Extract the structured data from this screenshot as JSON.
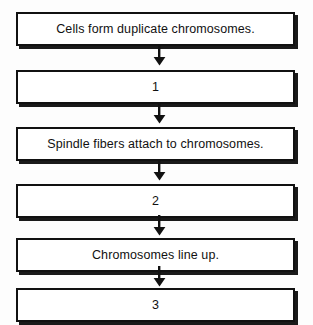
{
  "worksheet": {
    "background_color": "#fdfdfd",
    "ink_color": "#111111",
    "steps": [
      {
        "kind": "text",
        "label": "Cells form duplicate chromosomes."
      },
      {
        "kind": "blank",
        "label": "1"
      },
      {
        "kind": "text",
        "label": "Spindle fibers attach to chromosomes."
      },
      {
        "kind": "blank",
        "label": "2"
      },
      {
        "kind": "text",
        "label": "Chromosomes line up."
      },
      {
        "kind": "blank",
        "label": "3"
      }
    ],
    "connectors": [
      {
        "icon": "arrow-down-icon"
      },
      {
        "icon": "arrow-down-icon"
      },
      {
        "icon": "arrow-down-icon"
      },
      {
        "icon": "arrow-down-icon"
      },
      {
        "icon": "arrow-down-icon"
      }
    ]
  }
}
